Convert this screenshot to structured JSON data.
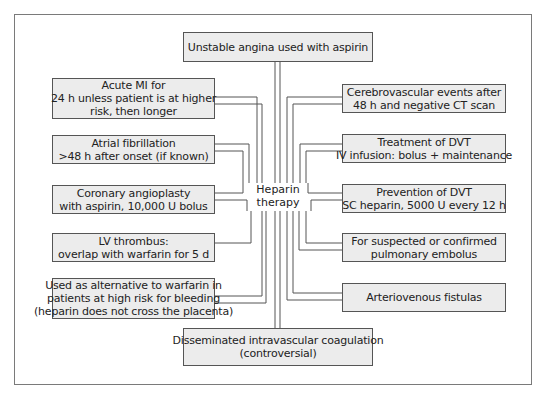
{
  "diagram": {
    "center": {
      "lines": [
        "Heparin",
        "therapy"
      ]
    },
    "top": {
      "lines": [
        "Unstable angina used with aspirin"
      ]
    },
    "bottom": {
      "lines": [
        "Disseminated intravascular coagulation",
        "(controversial)"
      ]
    },
    "left": [
      {
        "lines": [
          "Acute MI for",
          "24 h unless patient is at higher",
          "risk, then longer"
        ]
      },
      {
        "lines": [
          "Atrial fibrillation",
          ">48 h after onset (if known)"
        ]
      },
      {
        "lines": [
          "Coronary angioplasty",
          "with aspirin, 10,000 U bolus"
        ]
      },
      {
        "lines": [
          "LV thrombus:",
          "overlap with warfarin for 5 d"
        ]
      },
      {
        "lines": [
          "Used as alternative to warfarin in",
          "patients at high risk for bleeding",
          "(heparin does not cross the placenta)"
        ]
      }
    ],
    "right": [
      {
        "lines": [
          "Cerebrovascular events after",
          "48 h and negative CT scan"
        ]
      },
      {
        "lines": [
          "Treatment of DVT",
          "IV infusion: bolus + maintenance"
        ]
      },
      {
        "lines": [
          "Prevention of DVT",
          "SC heparin, 5000 U every 12 h"
        ]
      },
      {
        "lines": [
          "For suspected or confirmed",
          "pulmonary embolus"
        ]
      },
      {
        "lines": [
          "Arteriovenous fistulas"
        ]
      }
    ],
    "colors": {
      "box_fill": "#ececec",
      "box_border": "#555555",
      "line": "#555555",
      "frame": "#7a7a7a"
    }
  }
}
